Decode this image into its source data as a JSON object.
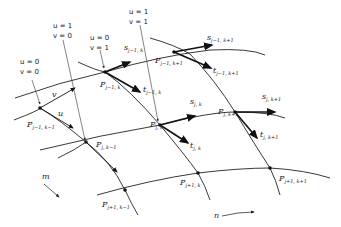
{
  "diagram": {
    "corner_annotations": [
      {
        "u": "u = 0",
        "v": "v = 0"
      },
      {
        "u": "u = 1",
        "v": "v = 0"
      },
      {
        "u": "u = 0",
        "v": "v = 1"
      },
      {
        "u": "u = 1",
        "v": "v = 1"
      }
    ],
    "nodes": [
      {
        "id": "P_{j-1,k-1}",
        "base": "P",
        "sub": "j−1, k−1"
      },
      {
        "id": "P_{j-1,k}",
        "base": "P",
        "sub": "j−1, k"
      },
      {
        "id": "P_{j-1,k+1}",
        "base": "P",
        "sub": "j−1, k+1"
      },
      {
        "id": "P_{j,k-1}",
        "base": "P",
        "sub": "j, k−1"
      },
      {
        "id": "P_{j,k}",
        "base": "P",
        "sub": "j, k"
      },
      {
        "id": "P_{j,k+1}",
        "base": "P",
        "sub": "j, k+1"
      },
      {
        "id": "P_{j+1,k-1}",
        "base": "P",
        "sub": "j+1, k−1"
      },
      {
        "id": "P_{j+1,k}",
        "base": "P",
        "sub": "j+1, k"
      },
      {
        "id": "P_{j+1,k+1}",
        "base": "P",
        "sub": "j+1, k+1"
      }
    ],
    "vectors": [
      {
        "base": "s",
        "sub": "j−1, k"
      },
      {
        "base": "s",
        "sub": "j−1, k+1"
      },
      {
        "base": "t",
        "sub": "j−1, k"
      },
      {
        "base": "t",
        "sub": "j−1, k+1"
      },
      {
        "base": "s",
        "sub": "j, k"
      },
      {
        "base": "s",
        "sub": "j, k+1"
      },
      {
        "base": "t",
        "sub": "j, k"
      },
      {
        "base": "t",
        "sub": "j, k+1"
      }
    ],
    "param_labels": {
      "u_edge": "u",
      "v_edge": "v"
    },
    "direction_labels": {
      "m": "m",
      "n": "n"
    }
  }
}
